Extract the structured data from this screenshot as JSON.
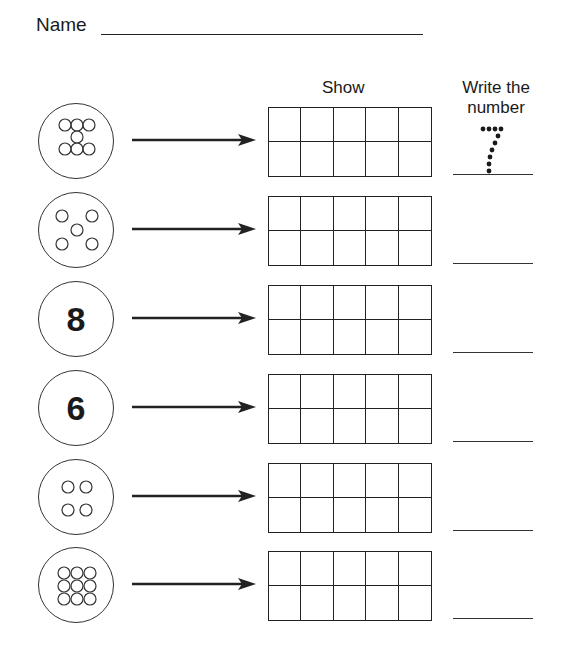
{
  "header": {
    "name_label": "Name",
    "col_show": "Show",
    "col_write_line1": "Write the",
    "col_write_line2": "number"
  },
  "rows": [
    {
      "type": "dots",
      "pattern": "z-seven",
      "count": 7,
      "answer_example": "7"
    },
    {
      "type": "dots",
      "pattern": "dice-five",
      "count": 5,
      "answer_example": ""
    },
    {
      "type": "numeral",
      "value": "8",
      "count": 8,
      "answer_example": ""
    },
    {
      "type": "numeral",
      "value": "6",
      "count": 6,
      "answer_example": ""
    },
    {
      "type": "dots",
      "pattern": "square-four",
      "count": 4,
      "answer_example": ""
    },
    {
      "type": "dots",
      "pattern": "grid-nine",
      "count": 9,
      "answer_example": ""
    }
  ],
  "ten_frame": {
    "columns": 5,
    "rows": 2
  },
  "traced_example": "7"
}
